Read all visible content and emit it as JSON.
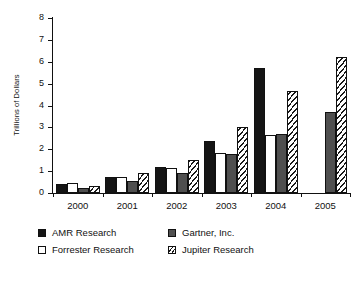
{
  "chart_data": {
    "type": "bar",
    "title": "",
    "subtitle": "",
    "xlabel": "",
    "ylabel": "Trillions of Dollars",
    "categories": [
      "2000",
      "2001",
      "2002",
      "2003",
      "2004",
      "2005"
    ],
    "ylim": [
      0,
      8
    ],
    "yticks": [
      0,
      1,
      2,
      3,
      4,
      5,
      6,
      7,
      8
    ],
    "ytick_labels": [
      "0",
      "1",
      "2",
      "3",
      "4",
      "5",
      "6",
      "7",
      "8"
    ],
    "grid": false,
    "legend_position": "bottom-left",
    "series": [
      {
        "name": "AMR Research",
        "style": "solid-black",
        "color": "#151515",
        "values": [
          0.42,
          0.72,
          1.2,
          2.4,
          5.7,
          null
        ]
      },
      {
        "name": "Forrester Research",
        "style": "solid-white",
        "color": "#ffffff",
        "values": [
          0.47,
          0.72,
          1.15,
          1.85,
          2.65,
          null
        ]
      },
      {
        "name": "Gartner, Inc.",
        "style": "solid-gray",
        "color": "#4f4f4f",
        "values": [
          0.22,
          0.53,
          0.9,
          1.8,
          2.7,
          3.7
        ]
      },
      {
        "name": "Jupiter Research",
        "style": "diagonal-hatch",
        "color": "#ffffff",
        "values": [
          0.32,
          0.92,
          1.5,
          3.0,
          4.65,
          6.2
        ]
      }
    ]
  },
  "legend": {
    "entries": [
      {
        "label": "AMR Research",
        "key": "amr"
      },
      {
        "label": "Gartner, Inc.",
        "key": "gartner"
      },
      {
        "label": "Forrester Research",
        "key": "forrester"
      },
      {
        "label": "Jupiter Research",
        "key": "jupiter"
      }
    ]
  }
}
